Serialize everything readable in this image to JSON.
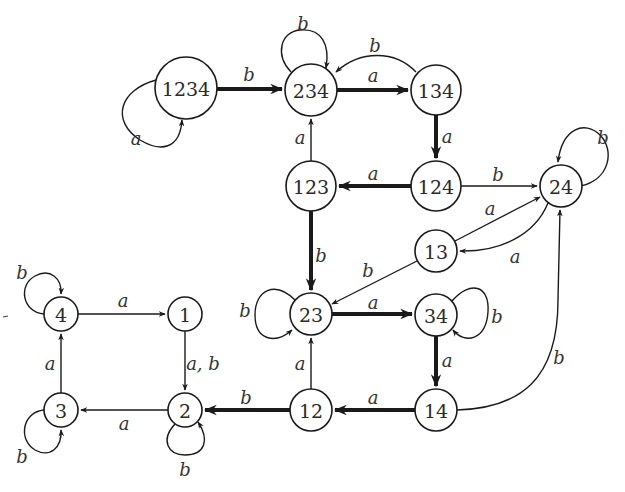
{
  "diagram": {
    "type": "finite-automaton-powerset",
    "colors": {
      "stroke": "#1a1a1a",
      "text": "#2a2a2a",
      "background": "#ffffff"
    },
    "nodes": [
      {
        "id": "1234",
        "label": "1234",
        "x": 186,
        "y": 88,
        "r": 31
      },
      {
        "id": "234",
        "label": "234",
        "x": 311,
        "y": 90,
        "r": 26
      },
      {
        "id": "134",
        "label": "134",
        "x": 436,
        "y": 90,
        "r": 25
      },
      {
        "id": "123",
        "label": "123",
        "x": 311,
        "y": 186,
        "r": 25
      },
      {
        "id": "124",
        "label": "124",
        "x": 436,
        "y": 186,
        "r": 25
      },
      {
        "id": "24",
        "label": "24",
        "x": 561,
        "y": 186,
        "r": 21
      },
      {
        "id": "13",
        "label": "13",
        "x": 436,
        "y": 251,
        "r": 21
      },
      {
        "id": "23",
        "label": "23",
        "x": 311,
        "y": 314,
        "r": 21
      },
      {
        "id": "34",
        "label": "34",
        "x": 436,
        "y": 315,
        "r": 21
      },
      {
        "id": "12",
        "label": "12",
        "x": 311,
        "y": 410,
        "r": 21
      },
      {
        "id": "14",
        "label": "14",
        "x": 436,
        "y": 410,
        "r": 21
      },
      {
        "id": "1",
        "label": "1",
        "x": 185,
        "y": 314,
        "r": 17
      },
      {
        "id": "2",
        "label": "2",
        "x": 185,
        "y": 410,
        "r": 17
      },
      {
        "id": "3",
        "label": "3",
        "x": 61,
        "y": 410,
        "r": 17
      },
      {
        "id": "4",
        "label": "4",
        "x": 61,
        "y": 314,
        "r": 17
      }
    ],
    "edges": [
      {
        "from": "1234",
        "to": "1234",
        "label": "a",
        "thick": false,
        "path": "M156,80 C120,90 110,120 140,140 C160,152 180,150 182,120",
        "lx": 136,
        "ly": 138
      },
      {
        "from": "1234",
        "to": "234",
        "label": "b",
        "thick": true,
        "path": "M217,89 L282,89",
        "lx": 249,
        "ly": 74
      },
      {
        "from": "234",
        "to": "234",
        "label": "b",
        "thick": false,
        "path": "M291,72 C275,55 280,32 300,30 C322,28 330,45 326,68",
        "lx": 303,
        "ly": 23
      },
      {
        "from": "134",
        "to": "234",
        "label": "b",
        "thick": false,
        "path": "M416,72 C395,50 360,50 336,72",
        "lx": 375,
        "ly": 45
      },
      {
        "from": "234",
        "to": "134",
        "label": "a",
        "thick": true,
        "path": "M337,90 L408,90",
        "lx": 373,
        "ly": 75
      },
      {
        "from": "134",
        "to": "124",
        "label": "a",
        "thick": true,
        "path": "M436,115 L436,158",
        "lx": 447,
        "ly": 136
      },
      {
        "from": "124",
        "to": "123",
        "label": "a",
        "thick": true,
        "path": "M411,186 L339,186",
        "lx": 373,
        "ly": 173
      },
      {
        "from": "123",
        "to": "234",
        "label": "a",
        "thick": false,
        "path": "M311,161 L311,119",
        "lx": 300,
        "ly": 137
      },
      {
        "from": "124",
        "to": "24",
        "label": "b",
        "thick": false,
        "path": "M461,186 L537,186",
        "lx": 498,
        "ly": 174
      },
      {
        "from": "24",
        "to": "24",
        "label": "b",
        "thick": false,
        "path": "M580,186 C610,180 615,150 600,135 C585,120 562,128 558,162",
        "lx": 603,
        "ly": 137
      },
      {
        "from": "13",
        "to": "24",
        "label": "a",
        "thick": false,
        "path": "M455,241 L540,197",
        "lx": 490,
        "ly": 208
      },
      {
        "from": "24",
        "to": "13",
        "label": "a",
        "thick": false,
        "path": "M548,203 C535,235 500,252 460,251",
        "lx": 515,
        "ly": 256
      },
      {
        "from": "123",
        "to": "23",
        "label": "b",
        "thick": true,
        "path": "M311,211 L311,290",
        "lx": 321,
        "ly": 255
      },
      {
        "from": "13",
        "to": "23",
        "label": "b",
        "thick": false,
        "path": "M417,261 L332,304",
        "lx": 368,
        "ly": 270
      },
      {
        "from": "23",
        "to": "23",
        "label": "b",
        "thick": false,
        "path": "M295,300 C275,280 255,290 255,315 C255,340 275,345 292,330",
        "lx": 245,
        "ly": 310
      },
      {
        "from": "23",
        "to": "34",
        "label": "a",
        "thick": true,
        "path": "M332,314 L412,314",
        "lx": 373,
        "ly": 302
      },
      {
        "from": "34",
        "to": "34",
        "label": "b",
        "thick": false,
        "path": "M452,301 C470,280 490,285 488,312 C486,340 465,345 453,330",
        "lx": 497,
        "ly": 316
      },
      {
        "from": "34",
        "to": "14",
        "label": "a",
        "thick": true,
        "path": "M436,336 L436,386",
        "lx": 447,
        "ly": 360
      },
      {
        "from": "14",
        "to": "24",
        "label": "b",
        "thick": false,
        "path": "M457,410 C520,408 558,380 558,300 L560,210",
        "lx": 559,
        "ly": 357
      },
      {
        "from": "14",
        "to": "12",
        "label": "a",
        "thick": true,
        "path": "M415,410 L335,410",
        "lx": 373,
        "ly": 397
      },
      {
        "from": "12",
        "to": "23",
        "label": "a",
        "thick": false,
        "path": "M311,389 L311,338",
        "lx": 300,
        "ly": 363
      },
      {
        "from": "12",
        "to": "2",
        "label": "b",
        "thick": true,
        "path": "M290,410 L205,410",
        "lx": 246,
        "ly": 397
      },
      {
        "from": "1",
        "to": "2",
        "label": "a, b",
        "thick": false,
        "path": "M185,331 L185,390",
        "lx": 203,
        "ly": 363
      },
      {
        "from": "2",
        "to": "2",
        "label": "b",
        "thick": false,
        "path": "M175,424 C160,440 168,455 185,455 C205,455 210,440 198,422",
        "lx": 185,
        "ly": 469
      },
      {
        "from": "2",
        "to": "3",
        "label": "a",
        "thick": false,
        "path": "M168,410 L81,410",
        "lx": 124,
        "ly": 423
      },
      {
        "from": "3",
        "to": "3",
        "label": "b",
        "thick": false,
        "path": "M44,410 C22,412 18,440 35,450 C50,458 62,448 61,430",
        "lx": 22,
        "ly": 456
      },
      {
        "from": "3",
        "to": "4",
        "label": "a",
        "thick": false,
        "path": "M61,393 L61,334",
        "lx": 50,
        "ly": 363
      },
      {
        "from": "4",
        "to": "4",
        "label": "b",
        "thick": false,
        "path": "M44,314 C22,312 18,285 35,276 C50,268 62,278 61,294",
        "lx": 22,
        "ly": 272
      },
      {
        "from": "4",
        "to": "1",
        "label": "a",
        "thick": false,
        "path": "M78,314 L165,314",
        "lx": 123,
        "ly": 300
      }
    ]
  }
}
